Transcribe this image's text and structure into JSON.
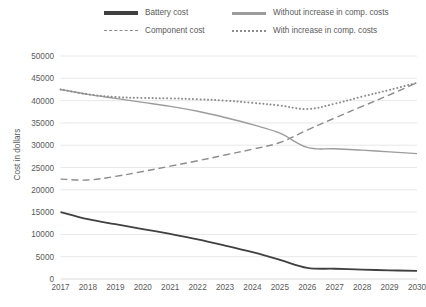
{
  "chart_data": {
    "type": "line",
    "title": "",
    "xlabel": "",
    "ylabel": "Cost in dollars",
    "categories": [
      "2017",
      "2018",
      "2019",
      "2020",
      "2021",
      "2022",
      "2023",
      "2024",
      "2025",
      "2026",
      "2027",
      "2028",
      "2029",
      "2030"
    ],
    "x": [
      2017,
      2018,
      2019,
      2020,
      2021,
      2022,
      2023,
      2024,
      2025,
      2026,
      2027,
      2028,
      2029,
      2030
    ],
    "ylim": [
      0,
      50000
    ],
    "y_ticks": [
      0,
      5000,
      10000,
      15000,
      20000,
      25000,
      30000,
      35000,
      40000,
      45000,
      50000
    ],
    "grid": "horizontal",
    "legend_position": "top",
    "series": [
      {
        "name": "Battery cost",
        "style": "solid",
        "color": "#404040",
        "width": 1.8,
        "values": [
          15000,
          13400,
          12300,
          11200,
          10100,
          8900,
          7500,
          6000,
          4300,
          2500,
          2300,
          2100,
          1950,
          1800
        ]
      },
      {
        "name": "Component cost",
        "style": "dashed",
        "color": "#8c8c8c",
        "width": 1.4,
        "values": [
          22400,
          22200,
          23000,
          24100,
          25300,
          26500,
          27800,
          29100,
          30600,
          33400,
          36100,
          38700,
          41300,
          44000
        ]
      },
      {
        "name": "Without increase in comp. costs",
        "style": "solid",
        "color": "#9c9c9c",
        "width": 1.4,
        "values": [
          42500,
          41400,
          40500,
          39600,
          38700,
          37600,
          36200,
          34600,
          32700,
          29500,
          29200,
          28900,
          28500,
          28100
        ]
      },
      {
        "name": "With increase in comp. costs",
        "style": "dotted",
        "color": "#8c8c8c",
        "width": 2.0,
        "values": [
          42500,
          41400,
          40800,
          40600,
          40500,
          40300,
          40000,
          39500,
          38900,
          38100,
          39300,
          40900,
          42400,
          44000
        ]
      }
    ]
  }
}
